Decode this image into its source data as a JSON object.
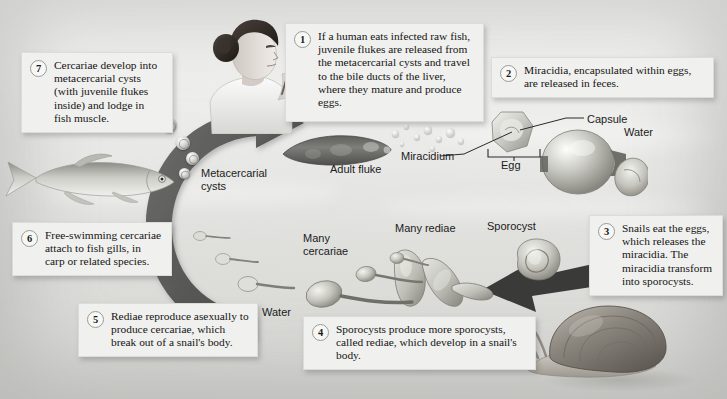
{
  "diagram": {
    "type": "biological-life-cycle-diagram",
    "background_color": "#eeeeec",
    "callout_background": "#f0f0ee",
    "arrow_color": "#5a5a58"
  },
  "steps": [
    {
      "number": "1",
      "text": "If a human eats infected raw fish, juvenile flukes are released from the metacercarial cysts and travel to the bile ducts of the liver, where they mature and produce eggs."
    },
    {
      "number": "2",
      "text": "Miracidia, encapsulated within eggs, are released in feces."
    },
    {
      "number": "3",
      "text": "Snails eat the eggs, which releases the miracidia. The miracidia transform into sporocysts."
    },
    {
      "number": "4",
      "text": "Sporocysts produce more sporocysts, called rediae, which develop in a snail's body."
    },
    {
      "number": "5",
      "text": "Rediae reproduce asexually to produce cercariae, which break out of a snail's body."
    },
    {
      "number": "6",
      "text": "Free-swimming cercariae attach to fish gills, in carp or related species."
    },
    {
      "number": "7",
      "text": "Cercariae develop into metacercarial cysts (with juvenile flukes inside) and lodge in fish muscle."
    }
  ],
  "labels": {
    "metacercarial_cysts": "Metacercarial\ncysts",
    "adult_fluke": "Adult fluke",
    "miracidium": "Miracidium",
    "capsule": "Capsule",
    "egg": "Egg",
    "water_right": "Water",
    "water_bottom": "Water",
    "many_cercariae": "Many\ncercariae",
    "many_rediae": "Many rediae",
    "sporocyst": "Sporocyst"
  },
  "illustrations": [
    {
      "name": "woman-eating-raw-fish",
      "description": "Woman eating raw fish with chopsticks"
    },
    {
      "name": "carp-fish",
      "description": "Carp or related fish species"
    },
    {
      "name": "adult-fluke",
      "description": "Adult liver fluke"
    },
    {
      "name": "egg-with-capsule",
      "description": "Egg containing miracidium with capsule"
    },
    {
      "name": "snail",
      "description": "Freshwater snail"
    },
    {
      "name": "sporocyst",
      "description": "Sporocyst stage"
    },
    {
      "name": "rediae",
      "description": "Rediae stage"
    },
    {
      "name": "cercariae",
      "description": "Free-swimming cercariae"
    },
    {
      "name": "metacercarial-cysts",
      "description": "Metacercarial cysts"
    }
  ]
}
